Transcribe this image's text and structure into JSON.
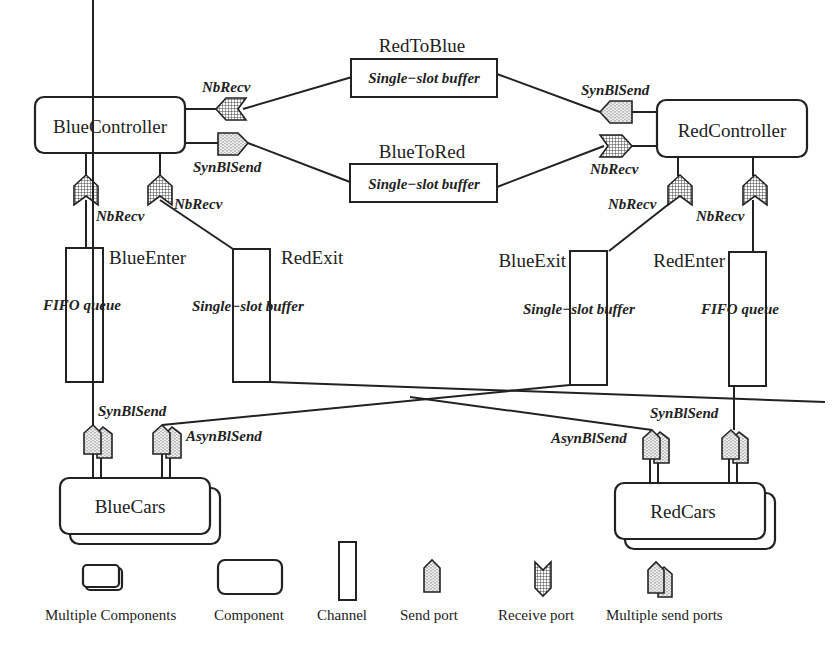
{
  "components": {
    "blue_controller": "BlueController",
    "red_controller": "RedController",
    "blue_cars": "BlueCars",
    "red_cars": "RedCars"
  },
  "channels": {
    "red_to_blue": {
      "name": "RedToBlue",
      "type": "Single−slot buffer"
    },
    "blue_to_red": {
      "name": "BlueToRed",
      "type": "Single−slot buffer"
    },
    "blue_enter": {
      "name": "BlueEnter",
      "type": "FIFO queue"
    },
    "red_exit": {
      "name": "RedExit",
      "type": "Single−slot buffer"
    },
    "blue_exit": {
      "name": "BlueExit",
      "type": "Single−slot buffer"
    },
    "red_enter": {
      "name": "RedEnter",
      "type": "FIFO queue"
    }
  },
  "ports": {
    "bc_nbrecv_top": "NbRecv",
    "bc_synblsend": "SynBlSend",
    "rc_synblsend": "SynBlSend",
    "rc_nbrecv_side": "NbRecv",
    "bc_nbrecv_left": "NbRecv",
    "bc_nbrecv_right": "NbRecv",
    "rc_nbrecv_left": "NbRecv",
    "rc_nbrecv_right": "NbRecv",
    "bcars_synblsend": "SynBlSend",
    "bcars_asynblsend": "AsynBlSend",
    "rcars_asynblsend": "AsynBlSend",
    "rcars_synblsend": "SynBlSend"
  },
  "legend": [
    {
      "label": "Multiple Components"
    },
    {
      "label": "Component"
    },
    {
      "label": "Channel"
    },
    {
      "label": "Send port"
    },
    {
      "label": "Receive port"
    },
    {
      "label": "Multiple send ports"
    }
  ]
}
